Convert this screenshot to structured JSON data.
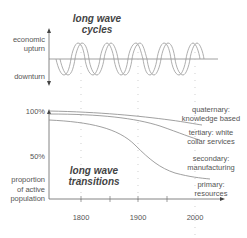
{
  "top_panel": {
    "title_line1": "long wave",
    "title_line2": "cycles",
    "y_label_top_line1": "economic",
    "y_label_top_line2": "upturn",
    "y_label_bottom": "downturn"
  },
  "bottom_panel": {
    "title_line1": "long wave",
    "title_line2": "transitions",
    "y_tick_100": "100%",
    "y_tick_50": "50%",
    "y_label_line1": "proportion",
    "y_label_line2": "of active",
    "y_label_line3": "population",
    "x_ticks": [
      "1800",
      "1900",
      "2000"
    ],
    "series_labels": [
      {
        "line1": "quaternary:",
        "line2": "knowledge based"
      },
      {
        "line1": "tertiary: white",
        "line2": "collar services"
      },
      {
        "line1": "secondary:",
        "line2": "manufacturing"
      },
      {
        "line1": "primary:",
        "line2": "resources"
      }
    ]
  },
  "colors": {
    "line": "#888888",
    "text": "#555555",
    "title": "#444444"
  }
}
